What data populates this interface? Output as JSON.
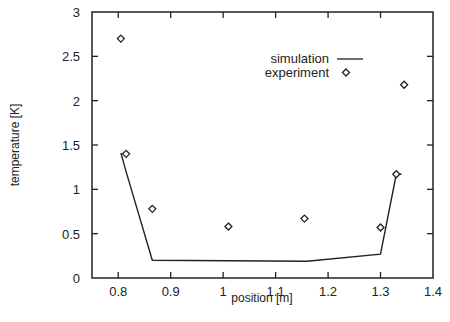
{
  "chart_data": {
    "type": "line",
    "title": "",
    "xlabel": "position [m]",
    "ylabel": "temperature [K]",
    "xlim": [
      0.75,
      1.4
    ],
    "ylim": [
      0,
      3
    ],
    "xticks": [
      0.8,
      0.9,
      1,
      1.1,
      1.2,
      1.3,
      1.4
    ],
    "xtick_labels": [
      "0.8",
      "0.9",
      "1",
      "1.1",
      "1.2",
      "1.3",
      "1.4"
    ],
    "yticks": [
      0,
      0.5,
      1,
      1.5,
      2,
      2.5,
      3
    ],
    "ytick_labels": [
      "0",
      "0.5",
      "1",
      "1.5",
      "2",
      "2.5",
      "3"
    ],
    "grid": false,
    "legend_position": "upper right (inside)",
    "series": [
      {
        "name": "simulation",
        "style": "line",
        "x": [
          0.805,
          0.815,
          0.865,
          1.16,
          1.3,
          1.33,
          1.34
        ],
        "y": [
          1.41,
          1.2,
          0.2,
          0.19,
          0.27,
          1.17,
          1.17
        ]
      },
      {
        "name": "experiment",
        "style": "diamond-markers",
        "x": [
          0.805,
          0.815,
          0.865,
          1.01,
          1.155,
          1.3,
          1.33,
          1.345
        ],
        "y": [
          2.7,
          1.4,
          0.78,
          0.58,
          0.67,
          0.57,
          1.17,
          2.18
        ]
      }
    ]
  },
  "legend": {
    "items": [
      {
        "label": "simulation",
        "symbol": "line"
      },
      {
        "label": "experiment",
        "symbol": "diamond"
      }
    ]
  }
}
